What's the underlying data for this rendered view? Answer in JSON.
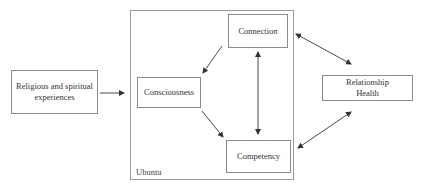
{
  "diagram": {
    "nodes": {
      "religious": {
        "label_line1": "Religious and spiritual",
        "label_line2": "experiences"
      },
      "consciousness": {
        "label": "Consciousness"
      },
      "connection": {
        "label": "Connection"
      },
      "competency": {
        "label": "Competency"
      },
      "relationship": {
        "label_line1": "Relationship",
        "label_line2": "Health"
      }
    },
    "group": {
      "label": "Ubuntu"
    },
    "edges": [
      {
        "from": "Religious and spiritual experiences",
        "to": "Ubuntu",
        "direction": "forward"
      },
      {
        "from": "Connection",
        "to": "Consciousness",
        "direction": "forward"
      },
      {
        "from": "Consciousness",
        "to": "Competency",
        "direction": "forward"
      },
      {
        "from": "Connection",
        "to": "Competency",
        "direction": "both"
      },
      {
        "from": "Connection",
        "to": "Relationship Health",
        "direction": "both"
      },
      {
        "from": "Competency",
        "to": "Relationship Health",
        "direction": "both"
      }
    ],
    "colors": {
      "line": "#333333",
      "border": "#8a8a8a",
      "text": "#333333"
    }
  }
}
